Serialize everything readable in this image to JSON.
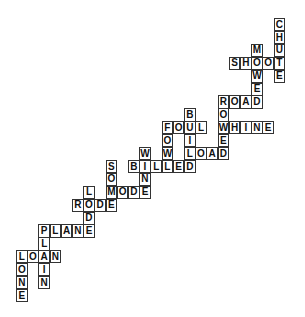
{
  "puzzle": {
    "grid": {
      "origin_x": 16,
      "origin_y": 18,
      "cell_w": 11.2,
      "cell_h": 12.9
    },
    "colors": {
      "border": "#333333",
      "text": "#111111",
      "background": "#ffffff"
    },
    "words": [
      {
        "word": "CHUTE",
        "dir": "down",
        "col": 23,
        "row": 0
      },
      {
        "word": "SHOOT",
        "dir": "across",
        "col": 19,
        "row": 3
      },
      {
        "word": "MOWED",
        "dir": "down",
        "col": 21,
        "row": 2
      },
      {
        "word": "ROAD",
        "dir": "across",
        "col": 18,
        "row": 6
      },
      {
        "word": "ROWED",
        "dir": "down",
        "col": 18,
        "row": 6
      },
      {
        "word": "WHINE",
        "dir": "across",
        "col": 18,
        "row": 8
      },
      {
        "word": "LOAD",
        "dir": "across",
        "col": 15,
        "row": 10
      },
      {
        "word": "BUILD",
        "dir": "down",
        "col": 15,
        "row": 7
      },
      {
        "word": "FOUL",
        "dir": "across",
        "col": 13,
        "row": 8
      },
      {
        "word": "FOWL",
        "dir": "down",
        "col": 13,
        "row": 8
      },
      {
        "word": "BILLED",
        "dir": "across",
        "col": 10,
        "row": 11
      },
      {
        "word": "WINE",
        "dir": "down",
        "col": 11,
        "row": 10
      },
      {
        "word": "MODE",
        "dir": "across",
        "col": 8,
        "row": 13
      },
      {
        "word": "SOME",
        "dir": "down",
        "col": 8,
        "row": 11
      },
      {
        "word": "RODE",
        "dir": "across",
        "col": 5,
        "row": 14
      },
      {
        "word": "LODE",
        "dir": "down",
        "col": 6,
        "row": 13
      },
      {
        "word": "PLANE",
        "dir": "across",
        "col": 2,
        "row": 16
      },
      {
        "word": "PLAIN",
        "dir": "down",
        "col": 2,
        "row": 16
      },
      {
        "word": "LOAN",
        "dir": "across",
        "col": 0,
        "row": 18
      },
      {
        "word": "LONE",
        "dir": "down",
        "col": 0,
        "row": 18
      }
    ]
  }
}
